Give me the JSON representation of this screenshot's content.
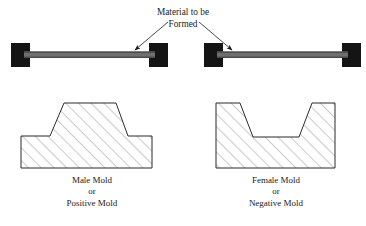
{
  "figure": {
    "title_label": {
      "line1": "Material to be",
      "line2": "Formed"
    },
    "left_caption": {
      "line1": "Male Mold",
      "line2": "or",
      "line3": "Positive Mold"
    },
    "right_caption": {
      "line1": "Female Mold",
      "line2": "or",
      "line3": "Negative Mold"
    },
    "colors": {
      "background": "#ffffff",
      "clamp_fill": "#141414",
      "sheet_fill": "#6f6f6f",
      "sheet_edge": "#3a3a3a",
      "outline": "#2b2b2b",
      "hatch": "#8a8a8a",
      "text": "#1a1a1a"
    },
    "annotations": {
      "leader_left": "arrow pointing down-left to left sheet",
      "leader_right": "arrow pointing down-right to right sheet"
    }
  }
}
